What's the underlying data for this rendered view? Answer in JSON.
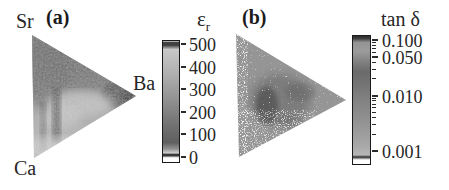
{
  "chart_data": [
    {
      "type": "heatmap",
      "subtype": "ternary_composition_spread",
      "panel_label": "(a)",
      "corners": {
        "top_left": "Sr",
        "bottom_left": "Ca",
        "right": "Ba"
      },
      "colorbar": {
        "title_symbol": "ε",
        "title_subscript": "r",
        "scale": "linear",
        "range": [
          0,
          520
        ],
        "ticks": [
          {
            "value": 500,
            "label": "500"
          },
          {
            "value": 400,
            "label": "400"
          },
          {
            "value": 300,
            "label": "300"
          },
          {
            "value": 200,
            "label": "200"
          },
          {
            "value": 100,
            "label": "100"
          },
          {
            "value": 0,
            "label": "0"
          }
        ]
      },
      "regions_estimated": [
        {
          "region": "Sr-rich upper area",
          "epsilon_r": 250
        },
        {
          "region": "band along Sr-Ba edge",
          "epsilon_r": 300
        },
        {
          "region": "dark spot near Ba vertex",
          "epsilon_r": 430
        },
        {
          "region": "light central horizontal band",
          "epsilon_r": 130
        },
        {
          "region": "dark vertical streak left of center",
          "epsilon_r": 350
        },
        {
          "region": "Ca-rich lower area",
          "epsilon_r": 100
        },
        {
          "region": "lower edge",
          "epsilon_r": 60
        }
      ],
      "note": "values estimated from grayscale shading of scanned figure"
    },
    {
      "type": "heatmap",
      "subtype": "ternary_composition_spread",
      "panel_label": "(b)",
      "colorbar": {
        "title": "tan δ",
        "scale": "log",
        "range": [
          0.0006,
          0.12
        ],
        "ticks": [
          {
            "value": 0.1,
            "label": "0.100"
          },
          {
            "value": 0.05,
            "label": "0.050"
          },
          {
            "value": 0.01,
            "label": "0.010"
          },
          {
            "value": 0.001,
            "label": "0.001"
          }
        ],
        "minor_ticks": [
          0.09,
          0.08,
          0.07,
          0.06,
          0.04,
          0.03,
          0.02,
          0.009,
          0.008,
          0.007,
          0.006,
          0.005,
          0.004,
          0.003,
          0.002
        ]
      },
      "regions_estimated": [
        {
          "region": "speckled background majority",
          "tan_delta": 0.01
        },
        {
          "region": "dark cluster left of center",
          "tan_delta": 0.04
        },
        {
          "region": "white speckles along left and lower edges",
          "tan_delta": 0.001
        }
      ],
      "note": "noisy pixel map; values estimated from grayscale"
    }
  ]
}
